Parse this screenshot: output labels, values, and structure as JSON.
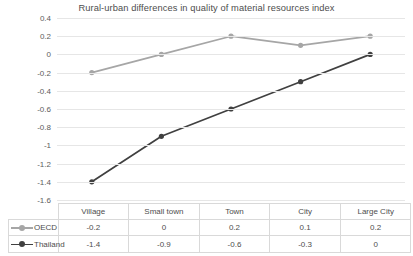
{
  "chart_data": {
    "type": "line",
    "title": "Rural-urban differences in quality of material resources index",
    "xlabel": "",
    "ylabel": "",
    "ylim": [
      -1.6,
      0.4
    ],
    "ytick_step": 0.2,
    "yticks": [
      "0.4",
      "0.2",
      "0",
      "-0.2",
      "-0.4",
      "-0.6",
      "-0.8",
      "-1",
      "-1.2",
      "-1.4",
      "-1.6"
    ],
    "grid": true,
    "legend_position": "table-left",
    "categories": [
      "Village",
      "Small town",
      "Town",
      "City",
      "Large City"
    ],
    "series": [
      {
        "name": "OECD",
        "values": [
          -0.2,
          0,
          0.2,
          0.1,
          0.2
        ],
        "labels": [
          "-0.2",
          "0",
          "0.2",
          "0.1",
          "0.2"
        ],
        "color": "#a6a6a6",
        "marker": "circle"
      },
      {
        "name": "Thailand",
        "values": [
          -1.4,
          -0.9,
          -0.6,
          -0.3,
          0
        ],
        "labels": [
          "-1.4",
          "-0.9",
          "-0.6",
          "-0.3",
          "0"
        ],
        "color": "#404040",
        "marker": "circle"
      }
    ]
  },
  "colors": {
    "oecd": "#a6a6a6",
    "thailand": "#404040",
    "gridline": "#e6e6e6",
    "table_border": "#d9d9d9",
    "text": "#4d4d4d"
  }
}
